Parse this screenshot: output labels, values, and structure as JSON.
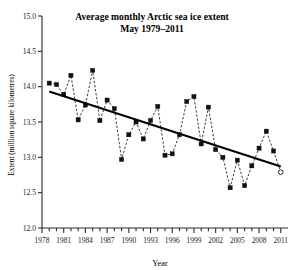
{
  "chart_data": {
    "type": "line",
    "title": "Average monthly Arctic sea ice extent",
    "subtitle": "May 1979–2011",
    "xlabel": "Year",
    "ylabel": "Extent (million square kilometres)",
    "xlim": [
      1978,
      2012
    ],
    "ylim": [
      12.0,
      15.0
    ],
    "grid": false,
    "legend": null,
    "y_ticks": [
      "12.0",
      "12.5",
      "13.0",
      "13.5",
      "14.0",
      "14.5",
      "15.0"
    ],
    "y_tick_values": [
      12.0,
      12.5,
      13.0,
      13.5,
      14.0,
      14.5,
      15.0
    ],
    "x_ticks": [
      "1978",
      "1981",
      "1984",
      "1987",
      "1990",
      "1993",
      "1996",
      "1999",
      "2002",
      "2005",
      "2008",
      "2011"
    ],
    "x_tick_values": [
      1978,
      1981,
      1984,
      1987,
      1990,
      1993,
      1996,
      1999,
      2002,
      2005,
      2008,
      2011
    ],
    "x_minor_step": 1,
    "series": [
      {
        "name": "May Arctic sea ice extent",
        "marker": "filled-square",
        "linestyle": "dashed",
        "x": [
          1979,
          1980,
          1981,
          1982,
          1983,
          1984,
          1985,
          1986,
          1987,
          1988,
          1989,
          1990,
          1991,
          1992,
          1993,
          1994,
          1995,
          1996,
          1997,
          1998,
          1999,
          2000,
          2001,
          2002,
          2003,
          2004,
          2005,
          2006,
          2007,
          2008,
          2009,
          2010,
          2011
        ],
        "values": [
          14.05,
          14.03,
          13.89,
          14.16,
          13.53,
          13.74,
          14.23,
          13.52,
          13.81,
          13.69,
          12.97,
          13.32,
          13.5,
          13.26,
          13.52,
          13.72,
          13.03,
          13.05,
          13.32,
          13.79,
          13.86,
          13.19,
          13.71,
          13.11,
          13.0,
          12.57,
          12.96,
          12.6,
          12.88,
          13.13,
          13.37,
          13.09,
          12.79
        ],
        "last_point_marker": "open-circle"
      },
      {
        "name": "Linear trend",
        "marker": "none",
        "linestyle": "solid",
        "x": [
          1979,
          2011
        ],
        "values": [
          13.93,
          12.87
        ]
      }
    ]
  },
  "colors": {
    "data_line": "#1a1a1a",
    "trend_line": "#000000",
    "marker": "#111111",
    "axis": "#2b2b2b",
    "background": "#ffffff"
  }
}
